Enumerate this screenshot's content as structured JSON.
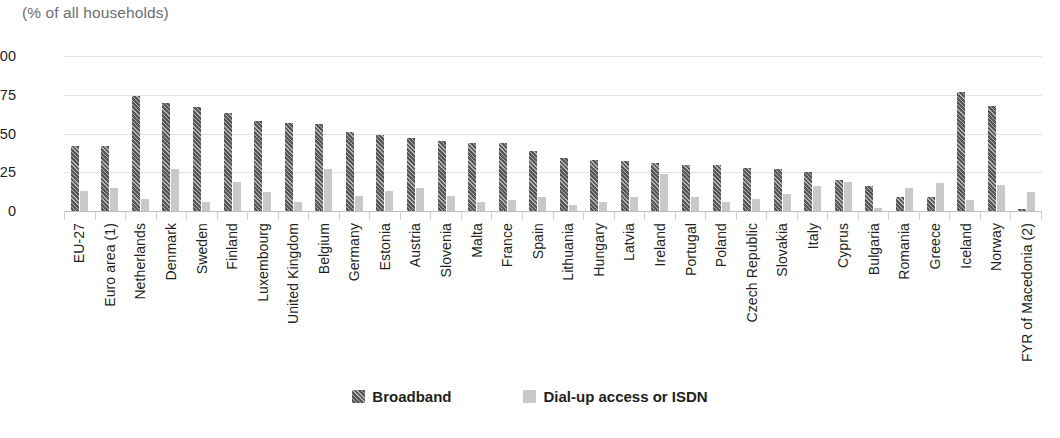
{
  "subtitle": "(% of all households)",
  "legend": {
    "items": [
      {
        "label": "Broadband",
        "key": "broadband",
        "color": "#575757"
      },
      {
        "label": "Dial-up access or ISDN",
        "key": "dialup",
        "color": "#c9c9c9"
      }
    ]
  },
  "chart_data": {
    "type": "bar",
    "title": "",
    "subtitle": "(% of all households)",
    "xlabel": "",
    "ylabel": "",
    "ylim": [
      0,
      100
    ],
    "yticks": [
      0,
      25,
      50,
      75,
      100
    ],
    "grid": true,
    "legend_position": "bottom",
    "categories": [
      "EU-27",
      "Euro area (1)",
      "Netherlands",
      "Denmark",
      "Sweden",
      "Finland",
      "Luxembourg",
      "United Kingdom",
      "Belgium",
      "Germany",
      "Estonia",
      "Austria",
      "Slovenia",
      "Malta",
      "France",
      "Spain",
      "Lithuania",
      "Hungary",
      "Latvia",
      "Ireland",
      "Portugal",
      "Poland",
      "Czech Republic",
      "Slovakia",
      "Italy",
      "Cyprus",
      "Bulgaria",
      "Romania",
      "Greece",
      "Iceland",
      "Norway",
      "FYR of Macedonia (2)"
    ],
    "series": [
      {
        "name": "Broadband",
        "color": "#575757",
        "values": [
          42,
          42,
          74,
          70,
          67,
          63,
          58,
          57,
          56,
          51,
          49,
          47,
          45,
          44,
          44,
          39,
          34,
          33,
          32,
          31,
          30,
          30,
          28,
          27,
          25,
          20,
          16,
          9,
          9,
          77,
          68,
          1
        ]
      },
      {
        "name": "Dial-up access or ISDN",
        "color": "#c9c9c9",
        "values": [
          13,
          15,
          8,
          27,
          6,
          19,
          12,
          6,
          27,
          10,
          13,
          15,
          10,
          6,
          7,
          9,
          4,
          6,
          9,
          24,
          9,
          6,
          8,
          11,
          16,
          19,
          2,
          15,
          18,
          7,
          17,
          12
        ]
      }
    ]
  }
}
